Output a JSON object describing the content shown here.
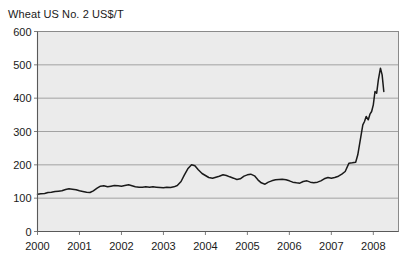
{
  "chart_data": {
    "type": "line",
    "title": "Wheat US No. 2 US$/T",
    "xlabel": "",
    "ylabel": "",
    "ylim": [
      0,
      600
    ],
    "xlim": [
      2000,
      2008.6
    ],
    "yticks": [
      0,
      100,
      200,
      300,
      400,
      500,
      600
    ],
    "ytick_labels": [
      "0",
      "100",
      "200",
      "300",
      "400",
      "500",
      "600"
    ],
    "xticks": [
      2000,
      2001,
      2002,
      2003,
      2004,
      2005,
      2006,
      2007,
      2008
    ],
    "xtick_labels": [
      "2000",
      "2001",
      "2002",
      "2003",
      "2004",
      "2005",
      "2006",
      "2007",
      "2008"
    ],
    "grid": "horizontal",
    "legend": "none",
    "plot_background": "#ebebeb",
    "line_color": "#1a1a1a",
    "series": [
      {
        "name": "Wheat US No. 2",
        "x": [
          2000.0,
          2000.08,
          2000.17,
          2000.25,
          2000.33,
          2000.42,
          2000.5,
          2000.58,
          2000.67,
          2000.75,
          2000.83,
          2000.92,
          2001.0,
          2001.08,
          2001.17,
          2001.25,
          2001.33,
          2001.42,
          2001.5,
          2001.58,
          2001.67,
          2001.75,
          2001.83,
          2001.92,
          2002.0,
          2002.08,
          2002.17,
          2002.25,
          2002.33,
          2002.42,
          2002.5,
          2002.58,
          2002.67,
          2002.75,
          2002.83,
          2002.92,
          2003.0,
          2003.08,
          2003.17,
          2003.25,
          2003.33,
          2003.42,
          2003.5,
          2003.58,
          2003.67,
          2003.75,
          2003.83,
          2003.92,
          2004.0,
          2004.08,
          2004.17,
          2004.25,
          2004.33,
          2004.42,
          2004.5,
          2004.58,
          2004.67,
          2004.75,
          2004.83,
          2004.92,
          2005.0,
          2005.08,
          2005.17,
          2005.25,
          2005.33,
          2005.42,
          2005.5,
          2005.58,
          2005.67,
          2005.75,
          2005.83,
          2005.92,
          2006.0,
          2006.08,
          2006.17,
          2006.25,
          2006.33,
          2006.42,
          2006.5,
          2006.58,
          2006.67,
          2006.75,
          2006.83,
          2006.92,
          2007.0,
          2007.08,
          2007.17,
          2007.25,
          2007.33,
          2007.42,
          2007.5,
          2007.58,
          2007.67,
          2007.75,
          2007.83,
          2007.92,
          2008.0,
          2008.08,
          2008.17,
          2008.25,
          2008.33,
          2008.42
        ],
        "values": [
          112,
          113,
          114,
          117,
          118,
          120,
          121,
          122,
          126,
          128,
          127,
          125,
          122,
          120,
          118,
          117,
          122,
          130,
          136,
          137,
          134,
          136,
          138,
          137,
          136,
          138,
          140,
          137,
          134,
          133,
          133,
          134,
          133,
          134,
          133,
          132,
          131,
          133,
          132,
          134,
          138,
          150,
          170,
          188,
          200,
          197,
          185,
          174,
          168,
          162,
          160,
          163,
          166,
          170,
          168,
          164,
          160,
          156,
          158,
          166,
          170,
          172,
          167,
          155,
          146,
          142,
          148,
          152,
          155,
          156,
          157,
          155,
          152,
          148,
          146,
          145,
          150,
          152,
          148,
          146,
          148,
          152,
          158,
          162,
          160,
          162,
          166,
          172,
          180,
          192,
          200,
          206,
          202,
          198,
          200,
          204,
          205,
          204,
          206,
          205,
          206,
          208
        ]
      },
      {
        "name": "Wheat US No. 2 (continued)",
        "x": [
          2007.42,
          2007.5,
          2007.58,
          2007.63,
          2007.67,
          2007.71,
          2007.75,
          2007.79,
          2007.83,
          2007.88,
          2007.92,
          2007.96,
          2008.0,
          2008.04,
          2008.08,
          2008.12,
          2008.17,
          2008.21,
          2008.25
        ],
        "values": [
          205,
          206,
          208,
          230,
          260,
          290,
          320,
          330,
          345,
          335,
          352,
          360,
          380,
          420,
          415,
          455,
          490,
          470,
          420
        ]
      }
    ]
  }
}
